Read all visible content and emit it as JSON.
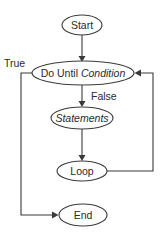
{
  "diagram": {
    "type": "flowchart",
    "colors": {
      "stroke": "#3a3a3a",
      "fill": "#ffffff",
      "text": "#2a2a2a"
    },
    "nodes": {
      "start": {
        "label": "Start"
      },
      "condition": {
        "prefix": "Do Until ",
        "label": "Condition"
      },
      "statements": {
        "label": "Statements"
      },
      "loop": {
        "label": "Loop"
      },
      "end": {
        "label": "End"
      }
    },
    "edges": {
      "true_label": "True",
      "false_label": "False"
    }
  }
}
